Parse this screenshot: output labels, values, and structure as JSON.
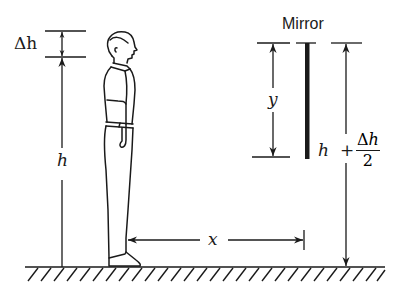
{
  "diagram": {
    "colors": {
      "ink": "#1a1a1a",
      "background": "#ffffff"
    },
    "labels": {
      "mirror": "Mirror",
      "delta_h": "Δh",
      "h_left": "h",
      "y": "y",
      "x": "x",
      "h_right": "h",
      "plus": "+",
      "frac_num_delta": "Δ",
      "frac_num_h": "h",
      "frac_den": "2"
    },
    "elements": [
      "ground-hatch",
      "person-silhouette",
      "height-arrow-h",
      "delta-h-dimension",
      "distance-arrow-x",
      "mirror-bar",
      "mirror-length-arrow-y",
      "mirror-top-height-arrow"
    ]
  }
}
